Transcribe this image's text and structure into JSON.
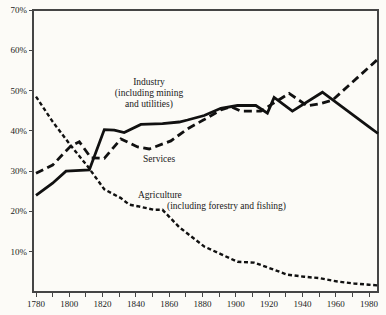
{
  "figure": {
    "background": "#fcfbf7",
    "line_color": "#111111",
    "axis_color": "#454545",
    "text_color": "#1b1b1b"
  },
  "labels": {
    "industry": {
      "line1": "Industry",
      "line2": "(including mining",
      "line3": "and utilities)"
    },
    "services": {
      "line1": "Services"
    },
    "agriculture": {
      "line1": "Agriculture",
      "line2": "(including forestry and fishing)"
    }
  },
  "chart_data": {
    "type": "line",
    "title": "",
    "xlabel": "",
    "ylabel": "",
    "grid": false,
    "legend_position": "inline-annotations",
    "extend_to_frame_edge": true,
    "x_axis": {
      "min": 1780,
      "max": 1980,
      "tick_values": [
        1780,
        1790,
        1800,
        1810,
        1820,
        1830,
        1840,
        1850,
        1860,
        1870,
        1880,
        1890,
        1900,
        1910,
        1920,
        1930,
        1940,
        1950,
        1960,
        1970,
        1980
      ],
      "label_values": [
        1780,
        1800,
        1820,
        1840,
        1860,
        1880,
        1900,
        1920,
        1940,
        1960,
        1980
      ],
      "tick_labels": [
        "1780",
        "1800",
        "1820",
        "1840",
        "1860",
        "1880",
        "1900",
        "1920",
        "1940",
        "1960",
        "1980"
      ]
    },
    "y_axis": {
      "min": 0,
      "max": 70,
      "tick_values": [
        10,
        20,
        30,
        40,
        50,
        60,
        70
      ],
      "tick_labels": [
        "10%",
        "20%",
        "30%",
        "40%",
        "50%",
        "60%",
        "70%"
      ]
    },
    "series": [
      {
        "id": "industry",
        "name": "Industry (including mining and utilities)",
        "style": "solid",
        "points": [
          [
            1780,
            24
          ],
          [
            1790,
            27
          ],
          [
            1798,
            30
          ],
          [
            1812,
            30.3
          ],
          [
            1821,
            40.3
          ],
          [
            1827,
            40.2
          ],
          [
            1833,
            39.6
          ],
          [
            1843,
            41.6
          ],
          [
            1856,
            41.8
          ],
          [
            1866,
            42.2
          ],
          [
            1871,
            42.7
          ],
          [
            1881,
            43.8
          ],
          [
            1891,
            45.6
          ],
          [
            1901,
            46.3
          ],
          [
            1912,
            46.3
          ],
          [
            1919,
            44.4
          ],
          [
            1923,
            48.3
          ],
          [
            1934,
            44.9
          ],
          [
            1952,
            49.6
          ],
          [
            1980,
            41
          ]
        ]
      },
      {
        "id": "services",
        "name": "Services",
        "style": "dashed",
        "points": [
          [
            1780,
            29.5
          ],
          [
            1790,
            31.5
          ],
          [
            1801,
            36.3
          ],
          [
            1806,
            37.3
          ],
          [
            1813,
            33.3
          ],
          [
            1821,
            33.2
          ],
          [
            1831,
            38
          ],
          [
            1841,
            36
          ],
          [
            1848,
            35.5
          ],
          [
            1861,
            37.5
          ],
          [
            1871,
            40.5
          ],
          [
            1881,
            42.8
          ],
          [
            1891,
            45.2
          ],
          [
            1897,
            46
          ],
          [
            1903,
            44.9
          ],
          [
            1915,
            44.9
          ],
          [
            1932,
            49.3
          ],
          [
            1943,
            46.2
          ],
          [
            1951,
            46.8
          ],
          [
            1958,
            47.6
          ],
          [
            1980,
            55.8
          ]
        ]
      },
      {
        "id": "agriculture",
        "name": "Agriculture (including forestry and fishing)",
        "style": "dense-dashed",
        "points": [
          [
            1780,
            48.5
          ],
          [
            1790,
            42.3
          ],
          [
            1801,
            36.3
          ],
          [
            1811,
            31.2
          ],
          [
            1821,
            25.5
          ],
          [
            1831,
            23.3
          ],
          [
            1836,
            21.7
          ],
          [
            1841,
            21.3
          ],
          [
            1851,
            20.4
          ],
          [
            1856,
            20.4
          ],
          [
            1866,
            16.1
          ],
          [
            1881,
            11.3
          ],
          [
            1891,
            9.4
          ],
          [
            1901,
            7.5
          ],
          [
            1911,
            7.3
          ],
          [
            1921,
            5.8
          ],
          [
            1931,
            4.3
          ],
          [
            1941,
            3.8
          ],
          [
            1951,
            3.4
          ],
          [
            1961,
            2.6
          ],
          [
            1971,
            2.1
          ],
          [
            1980,
            1.8
          ]
        ]
      }
    ]
  }
}
